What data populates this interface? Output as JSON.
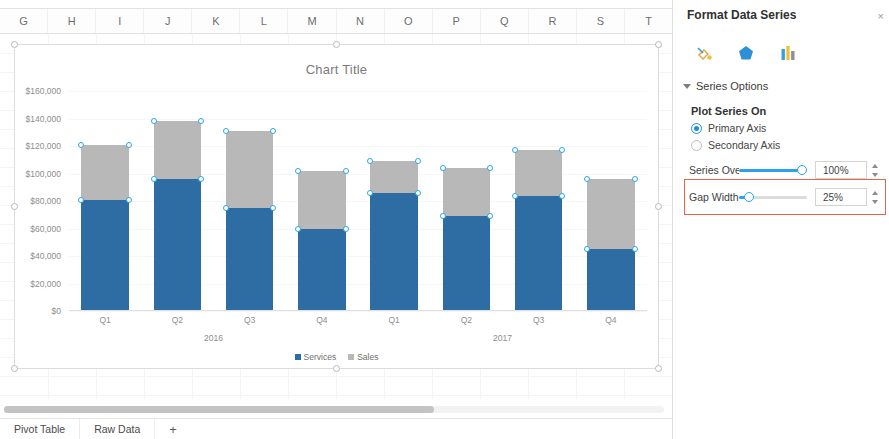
{
  "spreadsheet": {
    "columns": [
      "G",
      "H",
      "I",
      "J",
      "K",
      "L",
      "M",
      "N",
      "O",
      "P",
      "Q",
      "R",
      "S",
      "T"
    ],
    "sheet_tabs": [
      {
        "label": "Pivot Table"
      },
      {
        "label": "Raw Data"
      },
      {
        "label": "+"
      }
    ]
  },
  "chart_data": {
    "type": "bar",
    "subtype": "stacked-column",
    "title": "Chart Title",
    "xlabel": "",
    "ylabel": "",
    "grid": true,
    "legend_position": "bottom",
    "ylim": [
      0,
      160000
    ],
    "ytick_labels": [
      "$160,000",
      "$140,000",
      "$120,000",
      "$100,000",
      "$80,000",
      "$60,000",
      "$40,000",
      "$20,000",
      "$0"
    ],
    "ytick_values": [
      160000,
      140000,
      120000,
      100000,
      80000,
      60000,
      40000,
      20000,
      0
    ],
    "categories": [
      "Q1",
      "Q2",
      "Q3",
      "Q4",
      "Q1",
      "Q2",
      "Q3",
      "Q4"
    ],
    "group_labels": [
      "2016",
      "2017"
    ],
    "series": [
      {
        "name": "Services",
        "color": "#2e6ca4",
        "values": [
          81000,
          96000,
          75000,
          60000,
          86000,
          69000,
          84000,
          45000
        ]
      },
      {
        "name": "Sales",
        "color": "#b8b8b8",
        "values": [
          40000,
          42000,
          56000,
          42000,
          23000,
          35000,
          33000,
          51000
        ]
      }
    ],
    "selected_series": "Sales",
    "selection_handles_visible": true
  },
  "panel": {
    "title": "Format Data Series",
    "close_label": "×",
    "icons": [
      {
        "name": "fill-line-icon"
      },
      {
        "name": "effects-pentagon-icon"
      },
      {
        "name": "series-options-chart-icon"
      }
    ],
    "section": {
      "label": "Series Options",
      "expanded": true
    },
    "plot_series_on": {
      "label": "Plot Series On",
      "options": [
        {
          "label": "Primary Axis",
          "selected": true
        },
        {
          "label": "Secondary Axis",
          "selected": false
        }
      ]
    },
    "controls": [
      {
        "label": "Series Overl...",
        "value": "100%",
        "slider_percent": 100,
        "highlighted": false
      },
      {
        "label": "Gap Width",
        "value": "25%",
        "slider_percent": 8,
        "highlighted": true
      }
    ],
    "highlight_color": "#e4664a"
  }
}
